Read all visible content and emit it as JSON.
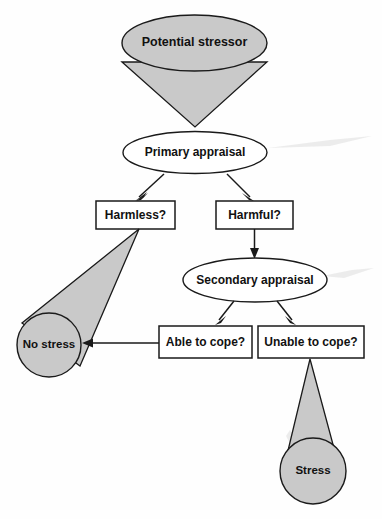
{
  "diagram": {
    "colors": {
      "shape_fill": "#c9c9c9",
      "shape_outline": "#1a1a1a",
      "box_fill": "#ffffff",
      "background": "#fefefe",
      "text": "#111111"
    },
    "nodes": {
      "potential_stressor": {
        "label": "Potential stressor",
        "shape": "cone",
        "filled": true
      },
      "primary_appraisal": {
        "label": "Primary appraisal",
        "shape": "ellipse",
        "filled": false
      },
      "harmless": {
        "label": "Harmless?",
        "shape": "rectangle",
        "filled": false
      },
      "harmful": {
        "label": "Harmful?",
        "shape": "rectangle",
        "filled": false
      },
      "secondary_appraisal": {
        "label": "Secondary appraisal",
        "shape": "ellipse",
        "filled": false
      },
      "able_to_cope": {
        "label": "Able to cope?",
        "shape": "rectangle",
        "filled": false
      },
      "unable_to_cope": {
        "label": "Unable to cope?",
        "shape": "rectangle",
        "filled": false
      },
      "no_stress": {
        "label": "No stress",
        "shape": "circle",
        "filled": true
      },
      "stress": {
        "label": "Stress",
        "shape": "circle",
        "filled": true
      }
    },
    "edges": [
      {
        "from": "potential_stressor",
        "to": "primary_appraisal",
        "style": "cone-funnel"
      },
      {
        "from": "primary_appraisal",
        "to": "harmless",
        "style": "arrow"
      },
      {
        "from": "primary_appraisal",
        "to": "harmful",
        "style": "arrow"
      },
      {
        "from": "harmless",
        "to": "no_stress",
        "style": "cone-funnel"
      },
      {
        "from": "harmful",
        "to": "secondary_appraisal",
        "style": "arrow"
      },
      {
        "from": "secondary_appraisal",
        "to": "able_to_cope",
        "style": "arrow"
      },
      {
        "from": "secondary_appraisal",
        "to": "unable_to_cope",
        "style": "arrow"
      },
      {
        "from": "able_to_cope",
        "to": "no_stress",
        "style": "arrow"
      },
      {
        "from": "unable_to_cope",
        "to": "stress",
        "style": "cone-funnel"
      }
    ]
  }
}
